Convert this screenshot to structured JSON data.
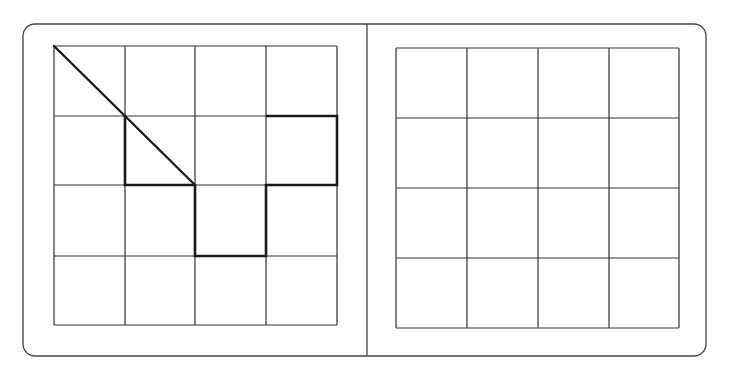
{
  "figure": {
    "colors": {
      "background": "#ffffff",
      "line": "#333333",
      "bold_line": "#1a1a1a"
    },
    "frame": {
      "x": 23,
      "y": 24,
      "width": 683,
      "height": 332,
      "radius": 12,
      "divider_x": 367
    },
    "left_grid": {
      "rows": 4,
      "cols": 4,
      "x_lines": [
        54,
        125,
        195,
        266,
        337
      ],
      "y_lines": [
        46,
        116,
        185,
        256,
        325
      ],
      "diagonal": [
        [
          54,
          46
        ],
        [
          195,
          185
        ]
      ],
      "bold_path": [
        [
          125,
          116
        ],
        [
          125,
          185
        ],
        [
          195,
          185
        ],
        [
          195,
          256
        ],
        [
          266,
          256
        ],
        [
          266,
          185
        ],
        [
          337,
          185
        ],
        [
          337,
          116
        ],
        [
          266,
          116
        ]
      ]
    },
    "right_grid": {
      "rows": 4,
      "cols": 4,
      "x_lines": [
        396,
        467,
        538,
        609,
        679
      ],
      "y_lines": [
        48,
        118,
        188,
        258,
        328
      ]
    }
  }
}
